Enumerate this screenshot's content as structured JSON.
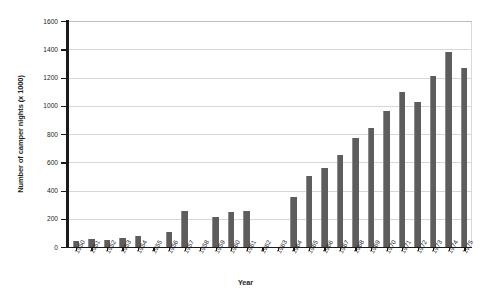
{
  "chart_data": {
    "type": "bar",
    "title": "",
    "xlabel": "Year",
    "ylabel": "Number of camper nights (x 1000)",
    "ylim": [
      0,
      1600
    ],
    "ytick_step": 200,
    "yticks": [
      0,
      200,
      400,
      600,
      800,
      1000,
      1200,
      1400,
      1600
    ],
    "ytick_labels": [
      "0",
      "200",
      "400",
      "600",
      "800",
      "1000",
      "1200",
      "1400",
      "1600"
    ],
    "grid": "horizontal",
    "legend": "none",
    "bar_color": "#5d5d5d",
    "categories": [
      "1950",
      "1951",
      "1952",
      "1953",
      "1954",
      "1955",
      "1956",
      "1957",
      "1958",
      "1959",
      "1960",
      "1961",
      "1962",
      "1963",
      "1964",
      "1965",
      "1966",
      "1967",
      "1968",
      "1969",
      "1970",
      "1971",
      "1972",
      "1973",
      "1974",
      "1975"
    ],
    "values": [
      40,
      55,
      50,
      65,
      80,
      0,
      105,
      255,
      0,
      215,
      250,
      255,
      0,
      0,
      355,
      505,
      560,
      650,
      770,
      840,
      960,
      1100,
      1030,
      1210,
      1380,
      1270
    ]
  }
}
